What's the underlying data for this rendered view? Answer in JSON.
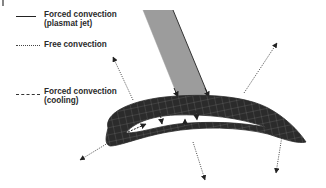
{
  "legend": {
    "items": [
      {
        "style": "solid",
        "label_line1": "Forced convection",
        "label_line2": "(plasmat jet)"
      },
      {
        "style": "dotted",
        "label_line1": "Free convection",
        "label_line2": ""
      },
      {
        "style": "dashed",
        "label_line1": "Forced convection",
        "label_line2": "(cooling)"
      }
    ]
  },
  "diagram": {
    "jet": "plasma jet impinging on airfoil",
    "colors": {
      "airfoil_fill": "#2b2b2b",
      "mesh_lines": "#9a9a9a",
      "jet_fill": "#9c9c9c",
      "jet_edge": "#333333",
      "arrows": "#222222"
    }
  }
}
